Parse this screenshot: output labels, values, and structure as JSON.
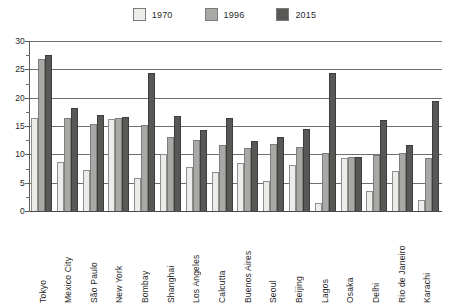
{
  "legend": {
    "entries": [
      {
        "label": "1970",
        "color": "#ececea",
        "icon": "legend-swatch-1970"
      },
      {
        "label": "1996",
        "color": "#a8a8a6",
        "icon": "legend-swatch-1996"
      },
      {
        "label": "2015",
        "color": "#585856",
        "icon": "legend-swatch-2015"
      }
    ]
  },
  "axis": {
    "y_ticks": [
      "0",
      "5",
      "10",
      "15",
      "20",
      "25",
      "30"
    ],
    "y_min": 0,
    "y_max": 30,
    "y_step": 5,
    "y_minor_step": 2.5
  },
  "chart_data": {
    "type": "bar",
    "title": "",
    "subtitle": "",
    "xlabel": "",
    "ylabel": "",
    "ylim": [
      0,
      30
    ],
    "grid": true,
    "legend_position": "top-center",
    "categories": [
      "Tokyo",
      "Mexico City",
      "São Paulo",
      "New York",
      "Bombay",
      "Shanghai",
      "Los Angeles",
      "Calcutta",
      "Buenos Aires",
      "Seoul",
      "Beijing",
      "Lagos",
      "Osaka",
      "Delhi",
      "Rio de Janeiro",
      "Karachi"
    ],
    "series": [
      {
        "name": "1970",
        "color": "#ececea",
        "values": [
          16.5,
          8.7,
          7.2,
          16.2,
          5.8,
          10.0,
          7.8,
          6.9,
          8.4,
          5.3,
          8.1,
          1.4,
          9.4,
          3.5,
          7.0,
          2.0
        ]
      },
      {
        "name": "1996",
        "color": "#a8a8a6",
        "values": [
          26.8,
          16.5,
          15.3,
          16.4,
          15.1,
          13.0,
          12.6,
          11.7,
          11.1,
          11.8,
          11.3,
          10.3,
          9.6,
          9.9,
          10.3,
          9.3
        ]
      },
      {
        "name": "2015",
        "color": "#585856",
        "values": [
          27.5,
          18.2,
          17.0,
          16.6,
          24.4,
          16.8,
          14.3,
          16.4,
          12.4,
          13.0,
          14.4,
          24.4,
          9.6,
          16.0,
          11.6,
          19.4
        ]
      }
    ]
  }
}
